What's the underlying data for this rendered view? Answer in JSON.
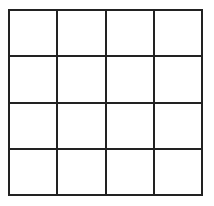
{
  "grid": {
    "rows": 4,
    "columns": 4,
    "line_color": "#222222",
    "background_color": "#ffffff",
    "cells": [
      [
        "",
        "",
        "",
        ""
      ],
      [
        "",
        "",
        "",
        ""
      ],
      [
        "",
        "",
        "",
        ""
      ],
      [
        "",
        "",
        "",
        ""
      ]
    ]
  }
}
